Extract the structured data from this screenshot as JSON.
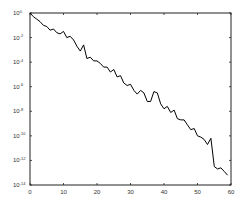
{
  "chart_data": {
    "type": "line",
    "title": "",
    "xlabel": "",
    "ylabel": "",
    "xscale": "linear",
    "yscale": "log",
    "xlim": [
      0,
      60
    ],
    "ylim": [
      1e-14,
      1
    ],
    "grid": false,
    "legend": null,
    "x_ticks": [
      0,
      10,
      20,
      30,
      40,
      50,
      60
    ],
    "x_tick_labels": [
      "0",
      "10",
      "20",
      "30",
      "40",
      "50",
      "60"
    ],
    "y_ticks_log10": [
      0,
      -2,
      -4,
      -6,
      -8,
      -10,
      -12,
      -14
    ],
    "y_tick_labels": [
      "10^0",
      "10^-2",
      "10^-4",
      "10^-6",
      "10^-8",
      "10^-10",
      "10^-12",
      "10^-14"
    ],
    "series": [
      {
        "name": "error",
        "color": "#000000",
        "x": [
          0,
          1,
          2,
          3,
          4,
          5,
          6,
          7,
          8,
          9,
          10,
          11,
          12,
          13,
          14,
          15,
          16,
          17,
          18,
          19,
          20,
          21,
          22,
          23,
          24,
          25,
          26,
          27,
          28,
          29,
          30,
          31,
          32,
          33,
          34,
          35,
          36,
          37,
          38,
          39,
          40,
          41,
          42,
          43,
          44,
          45,
          46,
          47,
          48,
          49,
          50,
          51,
          52,
          53,
          54,
          55,
          56,
          57,
          58,
          59
        ],
        "log10_y": [
          0,
          -0.3,
          -0.5,
          -0.7,
          -1.0,
          -1.1,
          -1.4,
          -1.3,
          -1.6,
          -1.7,
          -1.5,
          -2.0,
          -1.9,
          -2.2,
          -2.7,
          -3.1,
          -2.6,
          -3.7,
          -3.6,
          -3.9,
          -3.9,
          -4.1,
          -4.4,
          -4.4,
          -4.8,
          -4.6,
          -5.2,
          -5.1,
          -5.7,
          -5.9,
          -5.8,
          -6.3,
          -6.6,
          -6.3,
          -6.5,
          -7.2,
          -7.2,
          -6.4,
          -6.5,
          -7.4,
          -7.8,
          -7.6,
          -8.1,
          -7.9,
          -8.6,
          -8.7,
          -8.7,
          -9.1,
          -9.5,
          -9.4,
          -10.0,
          -10.1,
          -10.3,
          -10.7,
          -10.2,
          -12.5,
          -12.7,
          -12.6,
          -12.9,
          -13.2
        ]
      }
    ]
  }
}
